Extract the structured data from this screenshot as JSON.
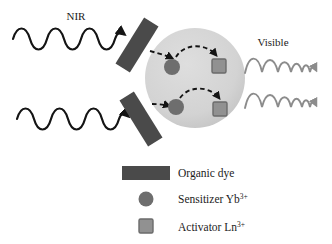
{
  "figure": {
    "title_labels": {
      "nir": "NIR",
      "visible": "Visible"
    },
    "background_color": "#ffffff",
    "nanoparticle": {
      "name": "nanoparticle-sphere",
      "fill": "#d4d4d4",
      "center_x": 195,
      "center_y": 78,
      "radius": 50
    },
    "dye_bars": [
      {
        "label": "upper-dye-bar",
        "fill": "#4a4a4a",
        "cx": 137,
        "cy": 45,
        "width": 17,
        "height": 52,
        "rotation_deg": 32
      },
      {
        "label": "lower-dye-bar",
        "fill": "#4a4a4a",
        "cx": 141,
        "cy": 119,
        "width": 17,
        "height": 52,
        "rotation_deg": -32
      }
    ],
    "sensitizers": [
      {
        "label": "sensitizer-upper",
        "fill": "#6e6e6e",
        "cx": 172,
        "cy": 67,
        "r": 8
      },
      {
        "label": "sensitizer-lower",
        "fill": "#6e6e6e",
        "cx": 176,
        "cy": 107,
        "r": 8
      }
    ],
    "activators": [
      {
        "label": "activator-upper",
        "fill": "#919191",
        "stroke": "#6b6b6b",
        "x": 212,
        "y": 59,
        "size": 14
      },
      {
        "label": "activator-lower",
        "fill": "#919191",
        "stroke": "#6b6b6b",
        "x": 213,
        "y": 102,
        "size": 14
      }
    ],
    "nir_waves": [
      {
        "label": "nir-wave-upper",
        "stroke": "#141414",
        "x_start": 13,
        "x_end": 124,
        "y_center": 39,
        "amplitude": 11,
        "cycles": 6
      },
      {
        "label": "nir-wave-lower",
        "stroke": "#141414",
        "x_start": 17,
        "x_end": 128,
        "y_center": 119,
        "amplitude": 11,
        "cycles": 6
      }
    ],
    "visible_waves": [
      {
        "label": "visible-wave-upper",
        "stroke": "#8c8c8c",
        "x_start": 245,
        "x_end": 320,
        "y_center": 64,
        "amplitude": 10
      },
      {
        "label": "visible-wave-lower",
        "stroke": "#8c8c8c",
        "x_start": 245,
        "x_end": 320,
        "y_center": 99,
        "amplitude": 10
      }
    ],
    "energy_transfer_arrows": {
      "stroke": "#141414",
      "style": "dashed",
      "count": 4
    }
  },
  "legend": {
    "items": [
      {
        "marker": "rectangle-swatch",
        "marker_color": "#4a4a4a",
        "label": "Organic dye",
        "superscript": ""
      },
      {
        "marker": "circle-swatch",
        "marker_color": "#6e6e6e",
        "label": "Sensitizer Yb",
        "superscript": "3+"
      },
      {
        "marker": "square-swatch",
        "marker_color": "#919191",
        "label": "Activator Ln",
        "superscript": "3+"
      }
    ]
  }
}
